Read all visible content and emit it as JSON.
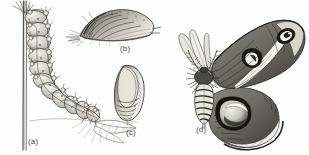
{
  "plate": {
    "kind": "scientific-illustration-plate",
    "subject": "Cecropia moth life cycle (engraving style line art)",
    "background_color": "#fdfdfb",
    "ink_color": "#3a3a38",
    "width": 309,
    "height": 155
  },
  "figures": [
    {
      "id": "a",
      "label": "(a)",
      "name": "caterpillar-on-stem",
      "description": "Segmented caterpillar with tubercles clinging to a vertical plant stem, with a leaf below",
      "label_position": {
        "x": 28,
        "y": 137
      }
    },
    {
      "id": "b",
      "label": "(b)",
      "name": "cocoon-on-twig",
      "description": "Silken cocoon spun along a twig, shaded with dense hatching",
      "label_position": {
        "x": 120,
        "y": 44
      }
    },
    {
      "id": "c",
      "label": "(c)",
      "name": "pupa",
      "description": "Oval segmented pupa or chrysalis, wing cases visible",
      "label_position": {
        "x": 126,
        "y": 128
      }
    },
    {
      "id": "d",
      "label": "(d)",
      "name": "adult-moth",
      "description": "Adult saturniid moth with feathery antennae, banded abdomen, and large crescent eyespots on fore and hind wings",
      "label_position": {
        "x": 196,
        "y": 125
      }
    }
  ]
}
